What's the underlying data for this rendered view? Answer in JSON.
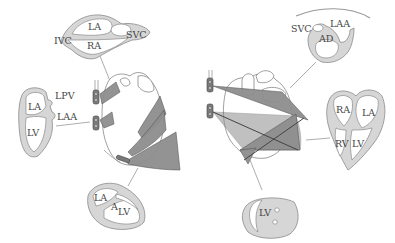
{
  "figure": {
    "left_panel": {
      "views": [
        {
          "id": "bicaval",
          "labels": {
            "la": "LA",
            "ra": "RA",
            "ivc": "IVC",
            "svc": "SVC"
          }
        },
        {
          "id": "two-chamber",
          "labels": {
            "la": "LA",
            "lv": "LV",
            "lpv": "LPV",
            "laa": "LAA"
          }
        },
        {
          "id": "long-axis",
          "labels": {
            "la": "LA",
            "lv": "LV",
            "a": "A"
          }
        }
      ]
    },
    "right_panel": {
      "views": [
        {
          "id": "basal-short-axis",
          "labels": {
            "svc": "SVC",
            "laa": "LAA",
            "ad": "AD"
          }
        },
        {
          "id": "four-chamber",
          "labels": {
            "ra": "RA",
            "la": "LA",
            "rv": "RV",
            "lv": "LV"
          }
        },
        {
          "id": "transgastric-short-axis",
          "labels": {
            "lv": "LV"
          }
        }
      ]
    },
    "colors": {
      "wall": "#d6d6d6",
      "outline": "#8a8a8a",
      "plane": "#8e8e8e",
      "text": "#444444",
      "background": "#ffffff"
    }
  }
}
